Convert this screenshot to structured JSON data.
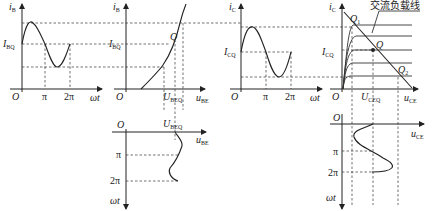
{
  "figure": {
    "panel_ib_time": {
      "y_axis": {
        "var": "i",
        "sub": "B"
      },
      "x_axis": "ωt",
      "origin": "O",
      "level": {
        "var": "I",
        "sub": "BQ"
      },
      "ticks": [
        "π",
        "2π"
      ]
    },
    "panel_input_characteristic": {
      "y_axis": {
        "var": "i",
        "sub": "B"
      },
      "x_axis": {
        "var": "u",
        "sub": "BE"
      },
      "origin": "O",
      "level": {
        "var": "I",
        "sub": "BQ"
      },
      "point": "Q",
      "x_mark": {
        "var": "U",
        "sub": "BEQ"
      }
    },
    "panel_ube_time": {
      "x_axis": {
        "var": "u",
        "sub": "BE"
      },
      "origin": "O",
      "x_mark": {
        "var": "U",
        "sub": "BEQ"
      },
      "ticks": [
        "π",
        "2π"
      ],
      "y_axis": "ωt"
    },
    "panel_ic_time": {
      "y_axis": {
        "var": "i",
        "sub": "C"
      },
      "x_axis": "ωt",
      "origin": "O",
      "level": {
        "var": "I",
        "sub": "CQ"
      },
      "ticks": [
        "π",
        "2π"
      ]
    },
    "panel_output_characteristic": {
      "y_axis": {
        "var": "i",
        "sub": "C"
      },
      "x_axis": {
        "var": "u",
        "sub": "CE"
      },
      "origin": "O",
      "level": {
        "var": "I",
        "sub": "CQ"
      },
      "points": [
        {
          "var": "Q",
          "sub": "1"
        },
        {
          "var": "Q",
          "sub": ""
        },
        {
          "var": "Q",
          "sub": "2"
        }
      ],
      "x_mark": {
        "var": "U",
        "sub": "CEQ"
      },
      "annotation": "交流负载线"
    },
    "panel_uce_time": {
      "x_axis": {
        "var": "u",
        "sub": "CE"
      },
      "origin": "O",
      "ticks": [
        "π",
        "2π"
      ],
      "y_axis": "ωt"
    }
  }
}
